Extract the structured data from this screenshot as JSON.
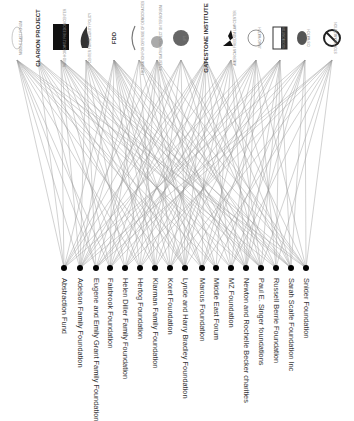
{
  "diagram": {
    "type": "bipartite-network",
    "edge_color": "#9a9a9a",
    "node_color": "#000000",
    "top_nodes": [
      {
        "id": "t0",
        "label": "Middle East Forum",
        "x": 17,
        "style": "round-emblem"
      },
      {
        "id": "t1",
        "label": "CLARION PROJECT",
        "x": 38,
        "style": "text-logo"
      },
      {
        "id": "t2",
        "label": "David Horowitz Freedom Center",
        "x": 61,
        "style": "black-box"
      },
      {
        "id": "t3",
        "label": "Center for Security Policy",
        "x": 86,
        "style": "flame-logo"
      },
      {
        "id": "t4",
        "label": "FDD",
        "x": 114,
        "style": "text-logo"
      },
      {
        "id": "t5",
        "label": "Foundation for Defense of Democracies",
        "x": 139,
        "style": "arc-logo"
      },
      {
        "id": "t6",
        "label": "Investigative Project on Terrorism",
        "x": 157,
        "style": "globe-emblem"
      },
      {
        "id": "t7",
        "label": "IPT",
        "x": 181,
        "style": "circle-logo"
      },
      {
        "id": "t8",
        "label": "GATESTONE INSTITUTE",
        "x": 206,
        "style": "text-logo"
      },
      {
        "id": "t9",
        "label": "American Freedom Law Center",
        "x": 231,
        "style": "mountain-logo"
      },
      {
        "id": "t10",
        "label": "Jihad Watch",
        "x": 256,
        "style": "seal-emblem"
      },
      {
        "id": "t11",
        "label": "NGO Monitor",
        "x": 280,
        "style": "box-logo"
      },
      {
        "id": "t12",
        "label": "CIS Watch",
        "x": 305,
        "style": "oval-emblem"
      },
      {
        "id": "t13",
        "label": "Stop Islamization",
        "x": 332,
        "style": "crossed-circle"
      }
    ],
    "bottom_nodes": [
      {
        "id": "b0",
        "label": "Abstraction Fund",
        "x": 64
      },
      {
        "id": "b1",
        "label": "Adelson Family Foundation",
        "x": 80
      },
      {
        "id": "b2",
        "label": "Eugene and Emily Grant Family Foundation",
        "x": 96
      },
      {
        "id": "b3",
        "label": "Fairbrook Foundation",
        "x": 110
      },
      {
        "id": "b4",
        "label": "Helen Diller Family Foundation",
        "x": 125
      },
      {
        "id": "b5",
        "label": "Hertog Foundation",
        "x": 140
      },
      {
        "id": "b6",
        "label": "Klarman Family Foundation",
        "x": 155
      },
      {
        "id": "b7",
        "label": "Koret Foundation",
        "x": 170
      },
      {
        "id": "b8",
        "label": "Lynde and Harry Bradley Foundation",
        "x": 185
      },
      {
        "id": "b9",
        "label": "Marcus Foundation",
        "x": 202
      },
      {
        "id": "b10",
        "label": "Middle East Forum",
        "x": 216
      },
      {
        "id": "b11",
        "label": "MZ Foundation",
        "x": 231
      },
      {
        "id": "b12",
        "label": "Newton and Rochelle Becker charities",
        "x": 246
      },
      {
        "id": "b13",
        "label": "Paul E. Singer foundations",
        "x": 261
      },
      {
        "id": "b14",
        "label": "Russell Berrie Foundation",
        "x": 276
      },
      {
        "id": "b15",
        "label": "Sarah Scaife Foundation Inc",
        "x": 291
      },
      {
        "id": "b16",
        "label": "Snider Foundation",
        "x": 306
      }
    ],
    "edges": [
      [
        0,
        0
      ],
      [
        0,
        1
      ],
      [
        0,
        2
      ],
      [
        0,
        3
      ],
      [
        0,
        5
      ],
      [
        0,
        7
      ],
      [
        0,
        9
      ],
      [
        0,
        10
      ],
      [
        0,
        12
      ],
      [
        0,
        14
      ],
      [
        0,
        16
      ],
      [
        1,
        0
      ],
      [
        1,
        2
      ],
      [
        1,
        4
      ],
      [
        1,
        6
      ],
      [
        1,
        8
      ],
      [
        1,
        11
      ],
      [
        1,
        13
      ],
      [
        1,
        15
      ],
      [
        2,
        0
      ],
      [
        2,
        1
      ],
      [
        2,
        3
      ],
      [
        2,
        5
      ],
      [
        2,
        7
      ],
      [
        2,
        8
      ],
      [
        2,
        10
      ],
      [
        2,
        12
      ],
      [
        2,
        13
      ],
      [
        2,
        15
      ],
      [
        2,
        16
      ],
      [
        3,
        1
      ],
      [
        3,
        2
      ],
      [
        3,
        4
      ],
      [
        3,
        6
      ],
      [
        3,
        8
      ],
      [
        3,
        9
      ],
      [
        3,
        11
      ],
      [
        3,
        13
      ],
      [
        3,
        14
      ],
      [
        3,
        15
      ],
      [
        4,
        0
      ],
      [
        4,
        1
      ],
      [
        4,
        3
      ],
      [
        4,
        5
      ],
      [
        4,
        6
      ],
      [
        4,
        7
      ],
      [
        4,
        8
      ],
      [
        4,
        9
      ],
      [
        4,
        10
      ],
      [
        4,
        12
      ],
      [
        4,
        13
      ],
      [
        4,
        15
      ],
      [
        4,
        16
      ],
      [
        5,
        1
      ],
      [
        5,
        3
      ],
      [
        5,
        6
      ],
      [
        5,
        9
      ],
      [
        5,
        12
      ],
      [
        5,
        14
      ],
      [
        5,
        16
      ],
      [
        6,
        0
      ],
      [
        6,
        2
      ],
      [
        6,
        4
      ],
      [
        6,
        5
      ],
      [
        6,
        7
      ],
      [
        6,
        8
      ],
      [
        6,
        10
      ],
      [
        6,
        11
      ],
      [
        6,
        13
      ],
      [
        6,
        16
      ],
      [
        7,
        0
      ],
      [
        7,
        1
      ],
      [
        7,
        3
      ],
      [
        7,
        6
      ],
      [
        7,
        8
      ],
      [
        7,
        12
      ],
      [
        7,
        14
      ],
      [
        7,
        15
      ],
      [
        8,
        0
      ],
      [
        8,
        1
      ],
      [
        8,
        2
      ],
      [
        8,
        4
      ],
      [
        8,
        5
      ],
      [
        8,
        7
      ],
      [
        8,
        8
      ],
      [
        8,
        9
      ],
      [
        8,
        11
      ],
      [
        8,
        13
      ],
      [
        8,
        15
      ],
      [
        8,
        16
      ],
      [
        9,
        1
      ],
      [
        9,
        3
      ],
      [
        9,
        4
      ],
      [
        9,
        6
      ],
      [
        9,
        8
      ],
      [
        9,
        10
      ],
      [
        9,
        12
      ],
      [
        9,
        13
      ],
      [
        9,
        15
      ],
      [
        10,
        0
      ],
      [
        10,
        2
      ],
      [
        10,
        3
      ],
      [
        10,
        5
      ],
      [
        10,
        7
      ],
      [
        10,
        9
      ],
      [
        10,
        11
      ],
      [
        10,
        12
      ],
      [
        10,
        14
      ],
      [
        10,
        16
      ],
      [
        11,
        1
      ],
      [
        11,
        2
      ],
      [
        11,
        4
      ],
      [
        11,
        6
      ],
      [
        11,
        7
      ],
      [
        11,
        9
      ],
      [
        11,
        12
      ],
      [
        11,
        13
      ],
      [
        11,
        14
      ],
      [
        11,
        15
      ],
      [
        12,
        0
      ],
      [
        12,
        3
      ],
      [
        12,
        5
      ],
      [
        12,
        8
      ],
      [
        12,
        10
      ],
      [
        12,
        11
      ],
      [
        12,
        12
      ],
      [
        12,
        15
      ],
      [
        12,
        16
      ],
      [
        13,
        1
      ],
      [
        13,
        2
      ],
      [
        13,
        4
      ],
      [
        13,
        7
      ],
      [
        13,
        9
      ],
      [
        13,
        11
      ],
      [
        13,
        13
      ],
      [
        13,
        14
      ],
      [
        13,
        16
      ]
    ]
  }
}
